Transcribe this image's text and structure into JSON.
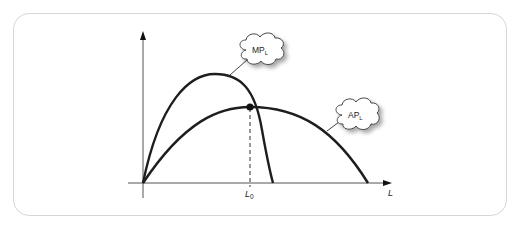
{
  "diagram": {
    "type": "economics-production-curves",
    "axes": {
      "x_label": "L",
      "y_label": ""
    },
    "curves": [
      {
        "name": "MP",
        "label_main": "MP",
        "label_sub": "L",
        "description": "Marginal product of labor, inverted-U, peaks early then falls steeply crossing the L axis"
      },
      {
        "name": "AP",
        "label_main": "AP",
        "label_sub": "L",
        "description": "Average product of labor, inverted-U, wider and lower"
      }
    ],
    "marker": {
      "label_main": "L",
      "label_sub": "0",
      "description": "MP intersects AP at the maximum of AP; dashed line drops to L0"
    }
  },
  "colors": {
    "frame_border": "#d6d6d6",
    "curve": "#1e1e1e",
    "axis": "#555555",
    "cloud_fill": "#ffffff",
    "cloud_shadow": "#bdbdbd"
  }
}
